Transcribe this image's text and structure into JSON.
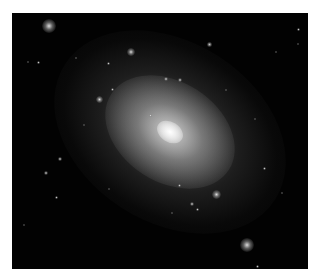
{
  "image": {
    "subject": "elliptical galaxy",
    "background_color": "#020202",
    "border_color": "#ffffff",
    "galaxy": {
      "center": [
        158,
        119
      ],
      "rotation_deg": 33
    },
    "bright_sources": [
      {
        "x": 37,
        "y": 13,
        "size": 14,
        "kind": "big"
      },
      {
        "x": 235,
        "y": 232,
        "size": 14,
        "kind": "big"
      },
      {
        "x": 197,
        "y": 31,
        "size": 5,
        "kind": "small"
      },
      {
        "x": 119,
        "y": 39,
        "size": 8,
        "kind": "big"
      },
      {
        "x": 87,
        "y": 86,
        "size": 7,
        "kind": "big"
      },
      {
        "x": 204,
        "y": 181,
        "size": 9,
        "kind": "big"
      },
      {
        "x": 48,
        "y": 146,
        "size": 4,
        "kind": "small"
      },
      {
        "x": 34,
        "y": 160,
        "size": 4,
        "kind": "small"
      },
      {
        "x": 44,
        "y": 184,
        "size": 3,
        "kind": "small"
      },
      {
        "x": 26,
        "y": 49,
        "size": 3,
        "kind": "small"
      },
      {
        "x": 16,
        "y": 49,
        "size": 2,
        "kind": "small"
      },
      {
        "x": 154,
        "y": 66,
        "size": 4,
        "kind": "small"
      },
      {
        "x": 168,
        "y": 67,
        "size": 4,
        "kind": "small"
      },
      {
        "x": 138,
        "y": 102,
        "size": 3,
        "kind": "small"
      },
      {
        "x": 100,
        "y": 76,
        "size": 3,
        "kind": "small"
      },
      {
        "x": 286,
        "y": 16,
        "size": 3,
        "kind": "small"
      },
      {
        "x": 286,
        "y": 31,
        "size": 2,
        "kind": "small"
      },
      {
        "x": 264,
        "y": 39,
        "size": 2,
        "kind": "small"
      },
      {
        "x": 243,
        "y": 106,
        "size": 2,
        "kind": "small"
      },
      {
        "x": 252,
        "y": 155,
        "size": 3,
        "kind": "small"
      },
      {
        "x": 180,
        "y": 191,
        "size": 4,
        "kind": "small"
      },
      {
        "x": 185,
        "y": 196,
        "size": 3,
        "kind": "small"
      },
      {
        "x": 167,
        "y": 172,
        "size": 3,
        "kind": "small"
      },
      {
        "x": 12,
        "y": 212,
        "size": 2,
        "kind": "small"
      },
      {
        "x": 245,
        "y": 253,
        "size": 3,
        "kind": "small"
      },
      {
        "x": 64,
        "y": 45,
        "size": 2,
        "kind": "small"
      },
      {
        "x": 96,
        "y": 50,
        "size": 3,
        "kind": "small"
      },
      {
        "x": 214,
        "y": 77,
        "size": 2,
        "kind": "small"
      },
      {
        "x": 270,
        "y": 180,
        "size": 2,
        "kind": "small"
      },
      {
        "x": 97,
        "y": 176,
        "size": 2,
        "kind": "small"
      },
      {
        "x": 72,
        "y": 112,
        "size": 2,
        "kind": "small"
      },
      {
        "x": 160,
        "y": 200,
        "size": 2,
        "kind": "small"
      }
    ]
  }
}
